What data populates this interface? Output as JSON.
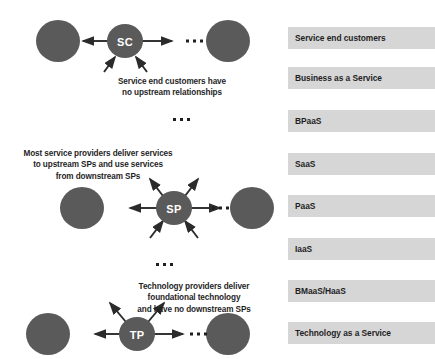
{
  "figure": {
    "node_fill": "#5a5a5a",
    "node_text_color": "#ffffff",
    "arrow_color": "#2b2b2b",
    "legend_bar_color": "#d6d6d6",
    "legend_text_color": "#1f1f1f",
    "background": "#ffffff"
  },
  "tiers": [
    {
      "id": "sc",
      "node_label": "SC",
      "caption": "Service end customers have\nno upstream relationships",
      "peer_left_label": "peer-node-left",
      "peer_right_label": "peer-node-right",
      "arrows": {
        "left": true,
        "right": true,
        "up_left": false,
        "up_right": false,
        "down_left": true,
        "down_right": true
      }
    },
    {
      "id": "sp",
      "node_label": "SP",
      "caption": "Most service providers deliver services\nto upstream SPs and use services\nfrom downstream SPs",
      "peer_left_label": "peer-node-left",
      "peer_right_label": "peer-node-right",
      "arrows": {
        "left": true,
        "right": true,
        "up_left": true,
        "up_right": true,
        "down_left": true,
        "down_right": true
      }
    },
    {
      "id": "tp",
      "node_label": "TP",
      "caption": "Technology providers deliver\nfoundational technology\nand have no downstream SPs",
      "peer_left_label": "peer-node-left",
      "peer_right_label": "peer-node-right",
      "arrows": {
        "left": true,
        "right": true,
        "up_left": true,
        "up_right": true,
        "down_left": false,
        "down_right": false
      }
    }
  ],
  "ellipsis": {
    "symbol": "• • •",
    "count": 3
  },
  "legend": {
    "items": [
      {
        "label": "Service end customers"
      },
      {
        "label": "Business as a Service"
      },
      {
        "label": "BPaaS"
      },
      {
        "label": "SaaS"
      },
      {
        "label": "PaaS"
      },
      {
        "label": "IaaS"
      },
      {
        "label": "BMaaS/HaaS"
      },
      {
        "label": "Technology as a Service"
      }
    ]
  }
}
